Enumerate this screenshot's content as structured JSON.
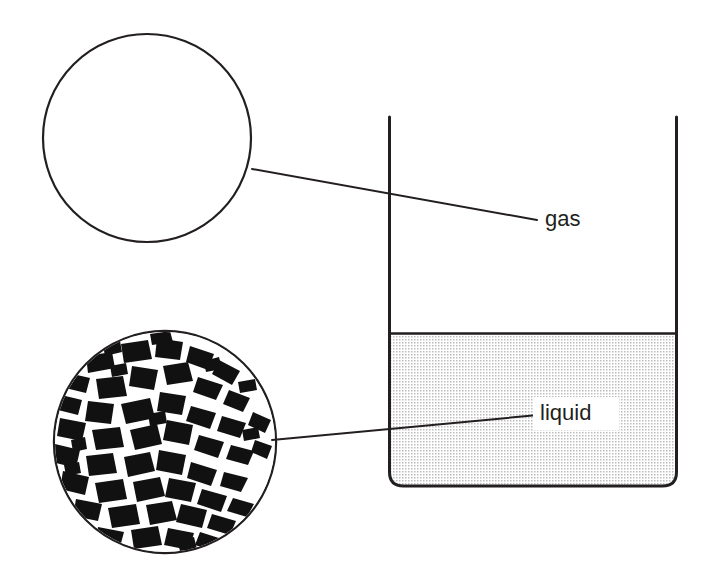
{
  "figure": {
    "background_color": "#ffffff",
    "line_color": "#231f20",
    "width": 712,
    "height": 574
  },
  "labels": {
    "gas": "gas",
    "liquid": "liquid"
  },
  "beaker": {
    "name": "beaker",
    "left_x": 388,
    "right_x": 678,
    "top_y": 117,
    "bottom_y": 487,
    "corner_radius": 14,
    "wall_color": "#231f20",
    "wall_width": 3,
    "open_top": true
  },
  "liquid_fill": {
    "name": "liquid-body",
    "surface_y": 333,
    "pattern": "dot-stipple",
    "dot_color": "#b8b8b8",
    "dot_pitch": 3,
    "fill_color": "#ffffff"
  },
  "magnifiers": [
    {
      "id": "gas-magnifier",
      "phase": "gas",
      "center_x": 147,
      "center_y": 138,
      "radius": 105,
      "fill": "#ffffff",
      "stroke": "#231f20",
      "stroke_width": 2,
      "description": "empty circle - widely separated gas particles"
    },
    {
      "id": "liquid-magnifier",
      "phase": "liquid",
      "center_x": 165,
      "center_y": 442,
      "radius": 111,
      "fill": "#ffffff",
      "particle_color": "#111111",
      "description": "densely packed irregular dark particles representing liquid molecules"
    }
  ],
  "leader_lines": [
    {
      "id": "gas-leader",
      "from_x": 252,
      "from_y": 169,
      "to_x": 537,
      "to_y": 220,
      "color": "#231f20",
      "width": 2
    },
    {
      "id": "liquid-leader",
      "from_x": 272,
      "from_y": 440,
      "to_x": 538,
      "to_y": 415,
      "color": "#231f20",
      "width": 2
    }
  ],
  "label_positions": {
    "gas": {
      "x": 545,
      "y": 220
    },
    "liquid": {
      "x": 540,
      "y": 414
    }
  }
}
